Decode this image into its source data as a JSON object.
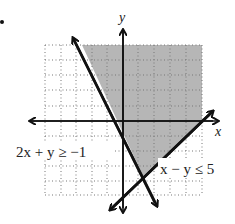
{
  "figure": {
    "bullet": "•",
    "axes": {
      "x_label": "x",
      "y_label": "y"
    },
    "grid": {
      "x_range": [
        -5,
        5
      ],
      "y_range": [
        -5,
        5
      ],
      "style": "dotted"
    },
    "inequalities": [
      {
        "label": "2x + y ≥ −1",
        "boundary": "2x + y = -1"
      },
      {
        "label": "x − y ≤ 5",
        "boundary": "x - y = 5"
      }
    ],
    "shading_color": "#a9a9a9"
  }
}
